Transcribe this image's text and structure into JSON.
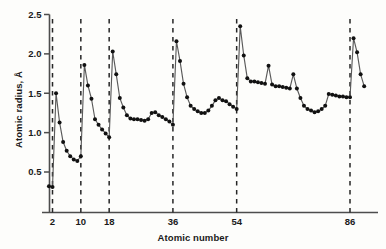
{
  "chart_data": {
    "type": "line",
    "title": "",
    "xlabel": "Atomic number",
    "ylabel": "Atomic radius, Å",
    "xlim": [
      0,
      100
    ],
    "ylim": [
      0.15,
      2.5
    ],
    "grid": false,
    "legend": null,
    "xticks": [
      2,
      10,
      18,
      36,
      54,
      86
    ],
    "xtick_labels": [
      "2",
      "10",
      "18",
      "36",
      "54",
      "86"
    ],
    "yticks": [
      0.5,
      1.0,
      1.5,
      2.0,
      2.5
    ],
    "ytick_labels": [
      "0.5",
      "1.0",
      "1.5",
      "2.0",
      "2.5"
    ],
    "dashed_verticals": [
      2,
      10,
      18,
      36,
      54,
      86
    ],
    "marker": "filled-circle",
    "marker_color": "#111111",
    "line_color": "#555555",
    "series": [
      {
        "name": "Atomic radius vs atomic number",
        "x": [
          1,
          2,
          3,
          4,
          5,
          6,
          7,
          8,
          9,
          10,
          11,
          12,
          13,
          14,
          15,
          16,
          17,
          18,
          19,
          20,
          21,
          22,
          23,
          24,
          25,
          26,
          27,
          28,
          29,
          30,
          31,
          32,
          33,
          34,
          35,
          36,
          37,
          38,
          39,
          40,
          41,
          42,
          43,
          44,
          45,
          46,
          47,
          48,
          49,
          50,
          51,
          52,
          53,
          54,
          55,
          56,
          57,
          58,
          59,
          60,
          61,
          62,
          63,
          64,
          65,
          66,
          67,
          68,
          69,
          70,
          71,
          72,
          73,
          74,
          75,
          76,
          77,
          78,
          79,
          80,
          81,
          82,
          83,
          84,
          85,
          86,
          87,
          88,
          89,
          90
        ],
        "y": [
          0.32,
          0.31,
          1.5,
          1.13,
          0.88,
          0.77,
          0.7,
          0.66,
          0.64,
          0.7,
          1.86,
          1.6,
          1.43,
          1.17,
          1.1,
          1.04,
          0.99,
          0.94,
          2.03,
          1.74,
          1.44,
          1.32,
          1.22,
          1.18,
          1.17,
          1.17,
          1.16,
          1.15,
          1.17,
          1.25,
          1.26,
          1.22,
          1.2,
          1.17,
          1.14,
          1.1,
          2.16,
          1.91,
          1.62,
          1.45,
          1.34,
          1.3,
          1.27,
          1.25,
          1.25,
          1.28,
          1.34,
          1.41,
          1.44,
          1.41,
          1.4,
          1.36,
          1.33,
          1.3,
          2.35,
          1.98,
          1.69,
          1.65,
          1.65,
          1.64,
          1.63,
          1.62,
          1.85,
          1.61,
          1.59,
          1.59,
          1.58,
          1.57,
          1.56,
          1.74,
          1.56,
          1.44,
          1.34,
          1.3,
          1.28,
          1.26,
          1.27,
          1.3,
          1.34,
          1.49,
          1.48,
          1.47,
          1.46,
          1.46,
          1.45,
          1.45,
          2.2,
          2.02,
          1.74,
          1.59
        ]
      }
    ],
    "annotations": []
  },
  "axes": {
    "x_title": "Atomic number",
    "y_title": "Atomic radius, Å"
  }
}
